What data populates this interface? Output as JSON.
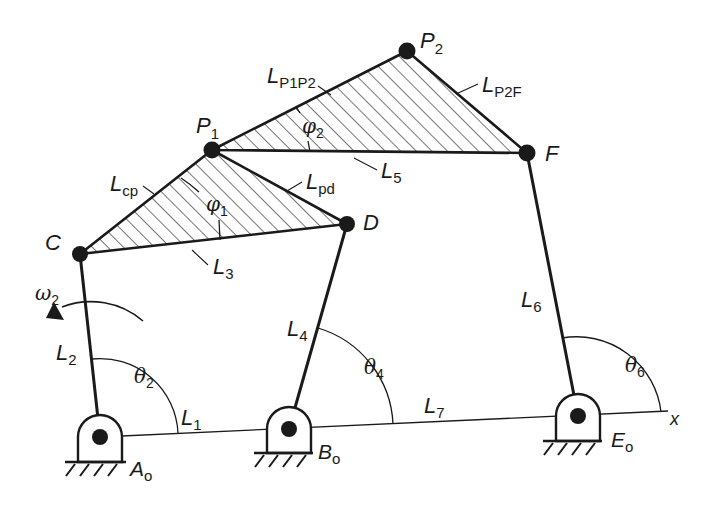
{
  "diagram": {
    "title": "",
    "type": "planar six-bar linkage kinematic diagram",
    "colors": {
      "ink": "#1a1a1a",
      "background": "#ffffff"
    },
    "joints": [
      {
        "id": "Ao",
        "label": "A",
        "sub": "o",
        "x": 100,
        "y": 437,
        "ground": true
      },
      {
        "id": "Bo",
        "label": "B",
        "sub": "o",
        "x": 289,
        "y": 429,
        "ground": true
      },
      {
        "id": "Eo",
        "label": "E",
        "sub": "o",
        "x": 578,
        "y": 416,
        "ground": true
      },
      {
        "id": "C",
        "label": "C",
        "sub": "",
        "x": 80,
        "y": 254
      },
      {
        "id": "D",
        "label": "D",
        "sub": "",
        "x": 347,
        "y": 224
      },
      {
        "id": "P1",
        "label": "P",
        "sub": "1",
        "x": 212,
        "y": 150
      },
      {
        "id": "P2",
        "label": "P",
        "sub": "2",
        "x": 407,
        "y": 51
      },
      {
        "id": "F",
        "label": "F",
        "sub": "",
        "x": 527,
        "y": 153
      }
    ],
    "links": [
      {
        "name": "L",
        "sub": "1",
        "from": "Ao",
        "to": "Bo"
      },
      {
        "name": "L",
        "sub": "2",
        "from": "Ao",
        "to": "C"
      },
      {
        "name": "L",
        "sub": "3",
        "from": "C",
        "to": "D"
      },
      {
        "name": "L",
        "sub": "4",
        "from": "Bo",
        "to": "D"
      },
      {
        "name": "L",
        "sub": "5",
        "from": "P1",
        "to": "F"
      },
      {
        "name": "L",
        "sub": "6",
        "from": "Eo",
        "to": "F"
      },
      {
        "name": "L",
        "sub": "7",
        "from": "Bo",
        "to": "Eo"
      },
      {
        "name": "L",
        "sub": "cp",
        "from": "C",
        "to": "P1"
      },
      {
        "name": "L",
        "sub": "pd",
        "from": "P1",
        "to": "D"
      },
      {
        "name": "L",
        "sub": "P1P2",
        "from": "P1",
        "to": "P2"
      },
      {
        "name": "L",
        "sub": "P2F",
        "from": "P2",
        "to": "F"
      }
    ],
    "labels": {
      "A": "A",
      "Ao_sub": "o",
      "B": "B",
      "Bo_sub": "o",
      "E": "E",
      "Eo_sub": "o",
      "C": "C",
      "D": "D",
      "F": "F",
      "P1": "P",
      "P1_sub": "1",
      "P2": "P",
      "P2_sub": "2",
      "L": "L",
      "L1_sub": "1",
      "L2_sub": "2",
      "L3_sub": "3",
      "L4_sub": "4",
      "L5_sub": "5",
      "L6_sub": "6",
      "L7_sub": "7",
      "Lcp_sub": "cp",
      "Lpd_sub": "pd",
      "LP1P2_sub": "P1P2",
      "LP2F_sub": "P2F",
      "theta": "θ",
      "theta2_sub": "2",
      "theta4_sub": "4",
      "theta6_sub": "6",
      "phi": "φ",
      "phi1_sub": "1",
      "phi2_sub": "2",
      "omega": "ω",
      "omega2_sub": "2",
      "x_axis": "x"
    },
    "angles": [
      {
        "symbol": "θ",
        "sub": "2",
        "vertex": "Ao",
        "between": [
          "x-axis",
          "L2"
        ]
      },
      {
        "symbol": "θ",
        "sub": "4",
        "vertex": "Bo",
        "between": [
          "x-axis",
          "L4"
        ]
      },
      {
        "symbol": "θ",
        "sub": "6",
        "vertex": "Eo",
        "between": [
          "x-axis",
          "L6"
        ]
      },
      {
        "symbol": "φ",
        "sub": "1",
        "vertex": "C",
        "between": [
          "L3",
          "Lcp"
        ]
      },
      {
        "symbol": "φ",
        "sub": "2",
        "vertex": "P1",
        "between": [
          "L5",
          "LP1P2"
        ]
      }
    ],
    "input": {
      "symbol": "ω",
      "sub": "2",
      "direction": "counterclockwise",
      "link": "L2"
    },
    "rigid_bodies": [
      {
        "name": "coupler-triangle-1",
        "vertices": [
          "C",
          "P1",
          "D"
        ],
        "hatched": true
      },
      {
        "name": "coupler-triangle-2",
        "vertices": [
          "P1",
          "P2",
          "F"
        ],
        "hatched": true
      }
    ]
  }
}
